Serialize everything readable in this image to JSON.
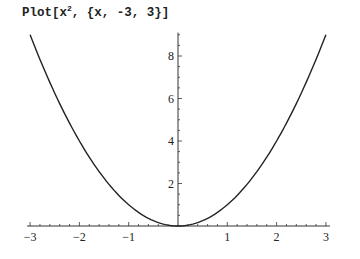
{
  "input": {
    "prefix": "Plot[x",
    "superscript": "2",
    "suffix": ", {x, -3, 3}]"
  },
  "chart_data": {
    "type": "line",
    "title": "",
    "function": "x^2",
    "xlabel": "",
    "ylabel": "",
    "xlim": [
      -3,
      3
    ],
    "ylim": [
      0,
      9
    ],
    "x_ticks": [
      -3,
      -2,
      -1,
      1,
      2,
      3
    ],
    "y_ticks": [
      2,
      4,
      6,
      8
    ],
    "x_tick_labels": [
      "-3",
      "-2",
      "-1",
      "1",
      "2",
      "3"
    ],
    "y_tick_labels": [
      "2",
      "4",
      "6",
      "8"
    ],
    "grid": false,
    "legend": null,
    "series": [
      {
        "name": "x^2",
        "x": [
          -3,
          -2.5,
          -2,
          -1.5,
          -1,
          -0.5,
          0,
          0.5,
          1,
          1.5,
          2,
          2.5,
          3
        ],
        "y": [
          9,
          6.25,
          4,
          2.25,
          1,
          0.25,
          0,
          0.25,
          1,
          2.25,
          4,
          6.25,
          9
        ]
      }
    ],
    "line_color": "#222222"
  }
}
